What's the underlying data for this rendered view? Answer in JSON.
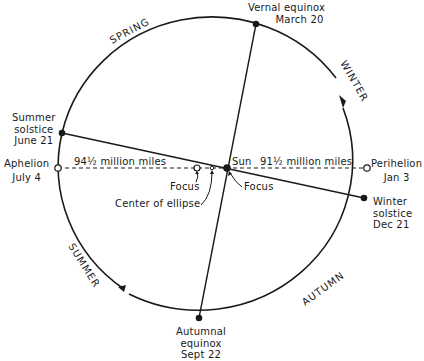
{
  "diagram": {
    "type": "earth-orbit-ellipse",
    "seasons": {
      "spring": "SPRING",
      "summer": "SUMMER",
      "autumn": "AUTUMN",
      "winter": "WINTER"
    },
    "points": {
      "vernal_equinox": {
        "line1": "Vernal equinox",
        "line2": "March 20"
      },
      "summer_solstice": {
        "line1": "Summer",
        "line2": "solstice",
        "line3": "June 21"
      },
      "aphelion": {
        "line1": "Aphelion",
        "line2": "July 4"
      },
      "perihelion": {
        "line1": "Perihelion",
        "line2": "Jan 3"
      },
      "winter_solstice": {
        "line1": "Winter",
        "line2": "solstice",
        "line3": "Dec 21"
      },
      "autumnal_equinox": {
        "line1": "Autumnal",
        "line2": "equinox",
        "line3": "Sept 22"
      }
    },
    "distances": {
      "aphelion": "94½ million miles",
      "perihelion": "91½ million miles"
    },
    "labels": {
      "sun": "Sun",
      "focus_left": "Focus",
      "focus_right": "Focus",
      "center": "Center of ellipse"
    }
  }
}
